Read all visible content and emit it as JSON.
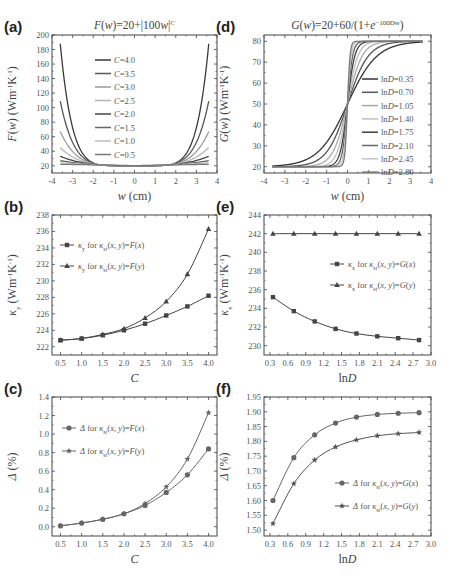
{
  "figure": {
    "width": 451,
    "height": 575
  },
  "chart_data": [
    {
      "id": "a",
      "panel_label": "(a)",
      "type": "line",
      "title": "F(w)=20+|100w|^C",
      "title_display": [
        "F(w)",
        "=20+|100w|",
        "C"
      ],
      "xlabel": "w (cm)",
      "ylabel": "F(w) (Wm⁻¹K⁻¹)",
      "xlim": [
        -4,
        4
      ],
      "ylim": [
        10,
        200
      ],
      "xticks": [
        -4,
        -3,
        -2,
        -1,
        0,
        1,
        2,
        3,
        4
      ],
      "yticks": [
        20,
        40,
        60,
        80,
        100,
        120,
        140,
        160,
        180,
        200
      ],
      "box": [
        52,
        35,
        217,
        173
      ],
      "x_range": [
        -3.6,
        3.6
      ],
      "legend": {
        "x": 95,
        "y": 60,
        "dy": 13.5
      },
      "series": [
        {
          "name": "C=4.0",
          "C": 4.0,
          "color": "#3a3a3a",
          "y_at_edge": 188
        },
        {
          "name": "C=3.5",
          "C": 3.5,
          "color": "#555555",
          "y_at_edge": 109
        },
        {
          "name": "C=3.0",
          "C": 3.0,
          "color": "#9a9a9a",
          "y_at_edge": 67
        },
        {
          "name": "C=2.5",
          "C": 2.5,
          "color": "#b5b5b5",
          "y_at_edge": 45
        },
        {
          "name": "C=2.0",
          "C": 2.0,
          "color": "#444444",
          "y_at_edge": 33
        },
        {
          "name": "C=1.5",
          "C": 1.5,
          "color": "#666666",
          "y_at_edge": 27
        },
        {
          "name": "C=1.0",
          "C": 1.0,
          "color": "#bdbdbd",
          "y_at_edge": 24
        },
        {
          "name": "C=0.5",
          "C": 0.5,
          "color": "#777777",
          "y_at_edge": 22
        }
      ]
    },
    {
      "id": "d",
      "panel_label": "(d)",
      "type": "line",
      "title": "G(w)=20+60/(1+e^(-100Dw))",
      "title_display": [
        "G(w)",
        "=20+60/(1+e",
        "-100Dw",
        ")"
      ],
      "xlabel": "w (cm)",
      "ylabel": "G(w) (Wm⁻¹K⁻¹)",
      "xlim": [
        -4,
        4
      ],
      "ylim": [
        17,
        83
      ],
      "xticks": [
        -4,
        -3,
        -2,
        -1,
        0,
        1,
        2,
        3,
        4
      ],
      "yticks": [
        20,
        30,
        40,
        50,
        60,
        70,
        80
      ],
      "box": [
        264,
        35,
        431,
        173
      ],
      "x_range": [
        -3.6,
        3.6
      ],
      "legend": {
        "x": 362,
        "y": 79,
        "dy": 13.3
      },
      "series": [
        {
          "name": "lnD=0.35",
          "lnD": 0.35,
          "color": "#333333"
        },
        {
          "name": "lnD=0.70",
          "lnD": 0.7,
          "color": "#555555"
        },
        {
          "name": "lnD=1.05",
          "lnD": 1.05,
          "color": "#a8a8a8"
        },
        {
          "name": "lnD=1.40",
          "lnD": 1.4,
          "color": "#bdbdbd"
        },
        {
          "name": "lnD=1.75",
          "lnD": 1.75,
          "color": "#3f3f3f"
        },
        {
          "name": "lnD=2.10",
          "lnD": 2.1,
          "color": "#666666"
        },
        {
          "name": "lnD=2.45",
          "lnD": 2.45,
          "color": "#c2c2c2"
        },
        {
          "name": "lnD=2.80",
          "lnD": 2.8,
          "color": "#7a7a7a"
        }
      ]
    },
    {
      "id": "b",
      "panel_label": "(b)",
      "type": "line",
      "title": "",
      "xlabel": "C",
      "ylabel": "κy (Wm⁻¹K⁻¹)",
      "xlim": [
        0.3,
        4.2
      ],
      "ylim": [
        221,
        238
      ],
      "xticks": [
        0.5,
        1.0,
        1.5,
        2.0,
        2.5,
        3.0,
        3.5,
        4.0
      ],
      "yticks": [
        222,
        224,
        226,
        228,
        230,
        232,
        234,
        236,
        238
      ],
      "box": [
        52,
        215,
        217,
        355
      ],
      "legend": {
        "x": 60,
        "y": 245,
        "dy": 21
      },
      "x": [
        0.5,
        1.0,
        1.5,
        2.0,
        2.5,
        3.0,
        3.5,
        4.0
      ],
      "series": [
        {
          "name": "κy for κst(x, y)=F(x)",
          "marker": "square",
          "color": "#444444",
          "values": [
            222.8,
            223.0,
            223.4,
            224.0,
            224.8,
            225.8,
            226.9,
            228.2
          ]
        },
        {
          "name": "κy for κst(x, y)=F(y)",
          "marker": "triangle",
          "color": "#444444",
          "values": [
            222.8,
            223.0,
            223.5,
            224.2,
            225.5,
            227.5,
            230.8,
            236.3
          ]
        }
      ]
    },
    {
      "id": "e",
      "panel_label": "(e)",
      "type": "line",
      "title": "",
      "xlabel": "lnD",
      "ylabel": "κx (Wm⁻¹K⁻¹)",
      "xlim": [
        0.2,
        3.0
      ],
      "ylim": [
        229,
        244
      ],
      "xticks": [
        0.3,
        0.6,
        0.9,
        1.2,
        1.5,
        1.8,
        2.1,
        2.4,
        2.7,
        3.0
      ],
      "yticks": [
        230,
        232,
        234,
        236,
        238,
        240,
        242,
        244
      ],
      "box": [
        264,
        215,
        431,
        355
      ],
      "legend": {
        "x": 330,
        "y": 264,
        "dy": 21
      },
      "x": [
        0.35,
        0.7,
        1.05,
        1.4,
        1.75,
        2.1,
        2.45,
        2.8
      ],
      "series": [
        {
          "name": "κx for κst(x, y)=G(x)",
          "marker": "square",
          "color": "#444444",
          "values": [
            235.2,
            233.7,
            232.6,
            231.8,
            231.3,
            231.0,
            230.8,
            230.6
          ]
        },
        {
          "name": "κx for κst(x, y)=G(y)",
          "marker": "triangle",
          "color": "#444444",
          "values": [
            242.0,
            242.0,
            242.0,
            242.0,
            242.0,
            242.0,
            242.0,
            242.0
          ]
        }
      ]
    },
    {
      "id": "c",
      "panel_label": "(c)",
      "type": "line",
      "title": "",
      "xlabel": "C",
      "ylabel": "Δ (%)",
      "xlim": [
        0.3,
        4.2
      ],
      "ylim": [
        -0.1,
        1.4
      ],
      "xticks": [
        0.5,
        1.0,
        1.5,
        2.0,
        2.5,
        3.0,
        3.5,
        4.0
      ],
      "yticks": [
        0.0,
        0.2,
        0.4,
        0.6,
        0.8,
        1.0,
        1.2,
        1.4
      ],
      "box": [
        52,
        397,
        217,
        536
      ],
      "legend": {
        "x": 62,
        "y": 428,
        "dy": 23
      },
      "x": [
        0.5,
        1.0,
        1.5,
        2.0,
        2.5,
        3.0,
        3.5,
        4.0
      ],
      "series": [
        {
          "name": "Δ for κst(x, y)=F(x)",
          "marker": "circle",
          "color": "#666666",
          "values": [
            0.01,
            0.04,
            0.08,
            0.14,
            0.23,
            0.37,
            0.56,
            0.84
          ]
        },
        {
          "name": "Δ for κst(x, y)=F(y)",
          "marker": "star",
          "color": "#666666",
          "values": [
            0.01,
            0.04,
            0.08,
            0.14,
            0.25,
            0.43,
            0.73,
            1.23
          ]
        }
      ]
    },
    {
      "id": "f",
      "panel_label": "(f)",
      "type": "line",
      "title": "",
      "xlabel": "lnD",
      "ylabel": "Δ (%)",
      "xlim": [
        0.2,
        3.0
      ],
      "ylim": [
        1.48,
        1.95
      ],
      "xticks": [
        0.3,
        0.6,
        0.9,
        1.2,
        1.5,
        1.8,
        2.1,
        2.4,
        2.7,
        3.0
      ],
      "yticks": [
        1.5,
        1.55,
        1.6,
        1.65,
        1.7,
        1.75,
        1.8,
        1.85,
        1.9,
        1.95
      ],
      "box": [
        264,
        397,
        431,
        536
      ],
      "legend": {
        "x": 335,
        "y": 483,
        "dy": 23
      },
      "x": [
        0.35,
        0.7,
        1.05,
        1.4,
        1.75,
        2.1,
        2.45,
        2.8
      ],
      "series": [
        {
          "name": "Δ for κst(x, y)=G(x)",
          "marker": "circle",
          "color": "#666666",
          "values": [
            1.6,
            1.745,
            1.822,
            1.862,
            1.882,
            1.891,
            1.895,
            1.897
          ]
        },
        {
          "name": "Δ for κst(x, y)=G(y)",
          "marker": "star",
          "color": "#555555",
          "values": [
            1.522,
            1.657,
            1.737,
            1.781,
            1.805,
            1.819,
            1.826,
            1.83
          ]
        }
      ]
    }
  ]
}
